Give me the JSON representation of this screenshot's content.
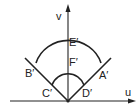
{
  "diagram": {
    "axes": {
      "horizontal_label": "u",
      "vertical_label": "v"
    },
    "points": {
      "A": "A′",
      "B": "B′",
      "C": "C′",
      "D": "D′",
      "E": "E′",
      "F": "F′"
    },
    "colors": {
      "ink": "#222222",
      "background": "#ffffff"
    }
  }
}
